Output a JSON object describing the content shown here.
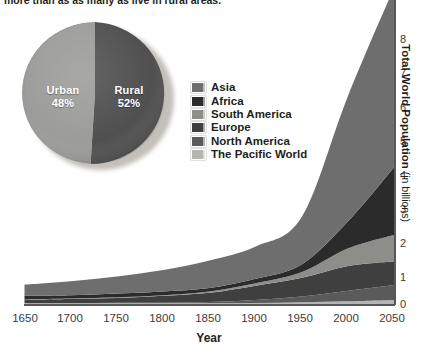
{
  "caption": {
    "text": "more than as as many as live in rural areas."
  },
  "pie": {
    "name": "urban-rural-pie",
    "slices": [
      {
        "label": "Urban",
        "percent": 48,
        "percent_text": "48%",
        "color": "#9a9a98"
      },
      {
        "label": "Rural",
        "percent": 52,
        "percent_text": "52%",
        "color": "#4c4c4c"
      }
    ]
  },
  "legend": {
    "items": [
      {
        "label": "Asia",
        "color": "#6e6e6e"
      },
      {
        "label": "Africa",
        "color": "#2b2b2b"
      },
      {
        "label": "South America",
        "color": "#8d8d8a"
      },
      {
        "label": "Europe",
        "color": "#3f3f3f"
      },
      {
        "label": "North America",
        "color": "#5a5a5a"
      },
      {
        "label": "The Pacific World",
        "color": "#b5b5b2"
      }
    ]
  },
  "axes": {
    "x_title": "Year",
    "y_title_bold": "Total World Population",
    "y_title_light": " (in billions)",
    "x_ticks": [
      "1650",
      "1700",
      "1750",
      "1800",
      "1850",
      "1900",
      "1950",
      "2000",
      "2050"
    ],
    "y_ticks": [
      "0",
      "1",
      "2",
      "3",
      "4",
      "5",
      "6",
      "7",
      "8"
    ]
  },
  "chart_data": {
    "type": "area",
    "stacked": true,
    "title": "",
    "xlabel": "Year",
    "ylabel": "Total World Population (in billions)",
    "xlim": [
      1650,
      2050
    ],
    "ylim": [
      0,
      8.6
    ],
    "xticks": [
      1650,
      1700,
      1750,
      1800,
      1850,
      1900,
      1950,
      2000,
      2050
    ],
    "yticks": [
      0,
      1,
      2,
      3,
      4,
      5,
      6,
      7,
      8
    ],
    "grid": false,
    "legend_position": "center-left",
    "x": [
      1650,
      1700,
      1750,
      1800,
      1850,
      1900,
      1950,
      2000,
      2050
    ],
    "series": [
      {
        "name": "The Pacific World",
        "color": "#b5b5b2",
        "values": [
          0.02,
          0.02,
          0.02,
          0.02,
          0.02,
          0.03,
          0.05,
          0.08,
          0.12
        ]
      },
      {
        "name": "North America",
        "color": "#5a5a5a",
        "values": [
          0.01,
          0.01,
          0.02,
          0.02,
          0.04,
          0.09,
          0.17,
          0.31,
          0.44
        ]
      },
      {
        "name": "Europe",
        "color": "#3f3f3f",
        "values": [
          0.1,
          0.12,
          0.14,
          0.2,
          0.27,
          0.42,
          0.55,
          0.73,
          0.7
        ]
      },
      {
        "name": "South America",
        "color": "#8d8d8a",
        "values": [
          0.01,
          0.01,
          0.02,
          0.02,
          0.04,
          0.07,
          0.17,
          0.52,
          0.78
        ]
      },
      {
        "name": "Africa",
        "color": "#2b2b2b",
        "values": [
          0.1,
          0.1,
          0.11,
          0.11,
          0.1,
          0.13,
          0.23,
          0.8,
          2.0
        ]
      },
      {
        "name": "Asia",
        "color": "#6e6e6e",
        "values": [
          0.33,
          0.41,
          0.5,
          0.63,
          0.81,
          0.95,
          1.4,
          3.7,
          5.3
        ]
      }
    ],
    "totals": [
      0.57,
      0.67,
      0.81,
      1.0,
      1.26,
      1.69,
      2.57,
      6.14,
      9.34
    ],
    "secondary_chart": {
      "type": "pie",
      "title": "",
      "labels": [
        "Urban",
        "Rural"
      ],
      "values": [
        48,
        52
      ],
      "colors": [
        "#9a9a98",
        "#4c4c4c"
      ]
    }
  }
}
